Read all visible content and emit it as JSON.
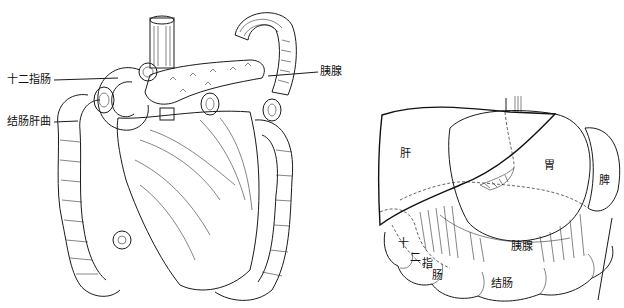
{
  "figure": {
    "left_panel": {
      "labels": [
        {
          "id": "duodenum",
          "text": "十二指肠"
        },
        {
          "id": "hepatic-flexure",
          "text": "结肠肝曲"
        },
        {
          "id": "pancreas",
          "text": "胰腺"
        }
      ]
    },
    "right_panel": {
      "labels": [
        {
          "id": "liver",
          "text": "肝"
        },
        {
          "id": "stomach",
          "text": "胃"
        },
        {
          "id": "spleen",
          "text": "脾"
        },
        {
          "id": "pancreas",
          "text": "胰腺"
        },
        {
          "id": "duodenum-1",
          "text": "十"
        },
        {
          "id": "duodenum-2",
          "text": "二"
        },
        {
          "id": "duodenum-3",
          "text": "指"
        },
        {
          "id": "duodenum-4",
          "text": "肠"
        },
        {
          "id": "colon",
          "text": "结肠"
        }
      ]
    }
  }
}
